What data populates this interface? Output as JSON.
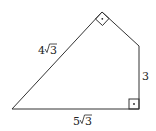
{
  "diagram": {
    "type": "quadrilateral",
    "vertices": {
      "A": [
        12,
        109
      ],
      "B": [
        102,
        12
      ],
      "C": [
        139,
        46
      ],
      "D": [
        139,
        109
      ]
    },
    "stroke_color": "#333333",
    "labels": {
      "side_AB": {
        "coef": "4",
        "radicand": "3"
      },
      "side_DA": {
        "coef": "5",
        "radicand": "3"
      },
      "side_CD": {
        "value": "3"
      }
    },
    "right_angles": [
      "B",
      "D"
    ]
  }
}
